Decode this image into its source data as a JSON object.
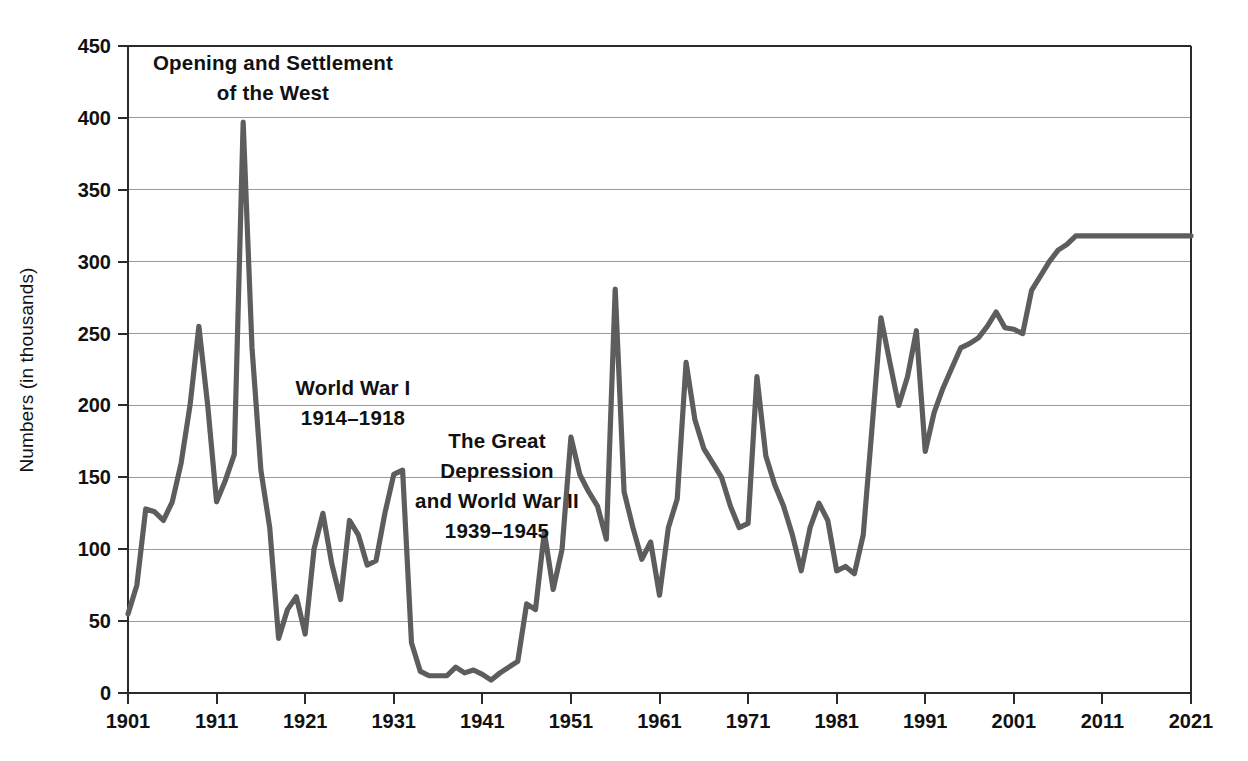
{
  "chart_data": {
    "type": "line",
    "title": "",
    "xlabel": "",
    "ylabel": "Numbers (in thousands)",
    "xlim": [
      1901,
      2021
    ],
    "ylim": [
      0,
      450
    ],
    "grid": true,
    "legend": "none",
    "y_ticks": [
      0,
      50,
      100,
      150,
      200,
      250,
      300,
      350,
      400,
      450
    ],
    "y_tick_labels": [
      "0",
      "50",
      "100",
      "150",
      "200",
      "250",
      "300",
      "350",
      "400",
      "450"
    ],
    "x_ticks": [
      1901,
      1911,
      1921,
      1931,
      1941,
      1951,
      1961,
      1971,
      1981,
      1991,
      2001,
      2011,
      2021
    ],
    "x_tick_labels": [
      "1901",
      "1911",
      "1921",
      "1931",
      "1941",
      "1951",
      "1961",
      "1971",
      "1981",
      "1991",
      "2001",
      "2011",
      "2021"
    ],
    "series": [
      {
        "name": "Immigrants admitted",
        "color": "#5d5d5d",
        "x": [
          1901,
          1902,
          1903,
          1904,
          1905,
          1906,
          1907,
          1908,
          1909,
          1910,
          1911,
          1912,
          1913,
          1914,
          1915,
          1916,
          1917,
          1918,
          1919,
          1920,
          1921,
          1922,
          1923,
          1924,
          1925,
          1926,
          1927,
          1928,
          1929,
          1930,
          1931,
          1932,
          1933,
          1934,
          1935,
          1936,
          1937,
          1938,
          1939,
          1940,
          1941,
          1942,
          1943,
          1944,
          1945,
          1946,
          1947,
          1948,
          1949,
          1950,
          1951,
          1952,
          1953,
          1954,
          1955,
          1956,
          1957,
          1958,
          1959,
          1960,
          1961,
          1962,
          1963,
          1964,
          1965,
          1966,
          1967,
          1968,
          1969,
          1970,
          1971,
          1972,
          1973,
          1974,
          1975,
          1976,
          1977,
          1978,
          1979,
          1980,
          1981,
          1982,
          1983,
          1984,
          1985,
          1986,
          1987,
          1988,
          1989,
          1990,
          1991,
          1992,
          1993,
          1994,
          1995,
          1996,
          1997,
          1998,
          1999,
          2000,
          2001,
          2002,
          2003,
          2004,
          2005,
          2006,
          2007,
          2008,
          2009,
          2010,
          2011,
          2012,
          2013,
          2014,
          2015,
          2016,
          2017,
          2018,
          2019,
          2020,
          2021
        ],
        "values": [
          55,
          75,
          128,
          126,
          120,
          133,
          160,
          200,
          255,
          200,
          133,
          148,
          166,
          397,
          240,
          155,
          115,
          38,
          58,
          67,
          41,
          100,
          125,
          90,
          65,
          120,
          110,
          89,
          92,
          125,
          152,
          155,
          35,
          15,
          12,
          12,
          12,
          18,
          14,
          16,
          13,
          9,
          14,
          18,
          22,
          62,
          58,
          112,
          72,
          100,
          178,
          152,
          140,
          130,
          107,
          281,
          140,
          115,
          93,
          105,
          68,
          115,
          135,
          230,
          190,
          170,
          160,
          150,
          130,
          115,
          118,
          220,
          165,
          145,
          130,
          110,
          85,
          115,
          132,
          120,
          85,
          88,
          83,
          110,
          185,
          261,
          230,
          200,
          220,
          252,
          168,
          195,
          212,
          226,
          240,
          243,
          247,
          255,
          265,
          254,
          253,
          250,
          280,
          290,
          300,
          308,
          312,
          318,
          318,
          318,
          318,
          318,
          318,
          318,
          318,
          318,
          318,
          318,
          318,
          318,
          318
        ]
      }
    ],
    "annotations": [
      {
        "id": "opening-west",
        "lines": [
          "Opening and Settlement",
          "of the West"
        ],
        "x": 273,
        "y": 70
      },
      {
        "id": "world-war-one",
        "lines": [
          "World War I",
          "1914–1918"
        ],
        "x": 353,
        "y": 395
      },
      {
        "id": "great-depression-wwii",
        "lines": [
          "The Great",
          "Depression",
          "and World War II",
          "1939–1945"
        ],
        "x": 497,
        "y": 448
      }
    ]
  },
  "axes": {
    "y_axis_title": "Numbers (in thousands)"
  },
  "watermark": {
    "ghost_text": ""
  }
}
